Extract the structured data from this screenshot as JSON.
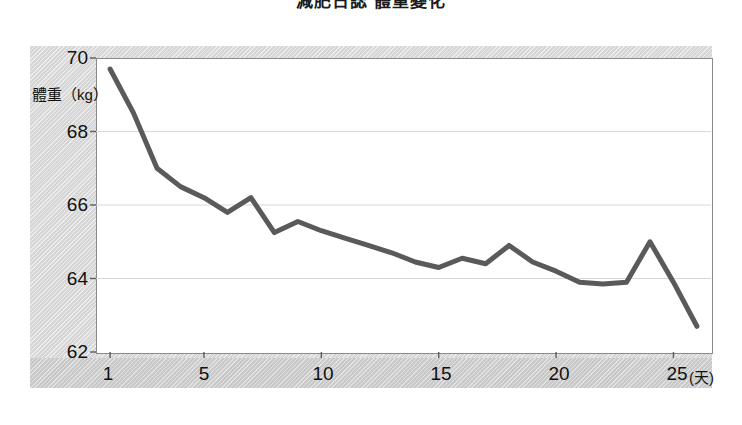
{
  "title": "減肥日誌 體重變化",
  "axes": {
    "y_title": "體重（kg）",
    "y_ticks": [
      70,
      68,
      66,
      64,
      62
    ],
    "x_ticks": [
      1,
      5,
      10,
      15,
      20,
      25
    ],
    "x_unit": "(天)"
  },
  "chart_data": {
    "type": "line",
    "title": "減肥日誌 體重變化",
    "xlabel": "(天)",
    "ylabel": "體重（kg）",
    "xlim": [
      0.4,
      26.6
    ],
    "ylim": [
      62,
      70
    ],
    "grid": true,
    "legend": false,
    "line_color": "#5a5a5a",
    "x": [
      1,
      2,
      3,
      4,
      5,
      6,
      7,
      8,
      9,
      10,
      11,
      12,
      13,
      14,
      15,
      16,
      17,
      18,
      19,
      20,
      21,
      22,
      23,
      24,
      25,
      26
    ],
    "values": [
      69.7,
      68.5,
      67.0,
      66.5,
      66.2,
      65.8,
      66.2,
      65.25,
      65.55,
      65.3,
      65.1,
      64.9,
      64.7,
      64.45,
      64.3,
      64.55,
      64.4,
      64.9,
      64.45,
      64.2,
      63.9,
      63.85,
      63.9,
      65.0,
      63.9,
      62.7
    ],
    "categories": [
      "1",
      "2",
      "3",
      "4",
      "5",
      "6",
      "7",
      "8",
      "9",
      "10",
      "11",
      "12",
      "13",
      "14",
      "15",
      "16",
      "17",
      "18",
      "19",
      "20",
      "21",
      "22",
      "23",
      "24",
      "25",
      "26"
    ],
    "series": [
      {
        "name": "體重（kg）",
        "values": [
          69.7,
          68.5,
          67.0,
          66.5,
          66.2,
          65.8,
          66.2,
          65.25,
          65.55,
          65.3,
          65.1,
          64.9,
          64.7,
          64.45,
          64.3,
          64.55,
          64.4,
          64.9,
          64.45,
          64.2,
          63.9,
          63.85,
          63.9,
          65.0,
          63.9,
          62.7
        ]
      }
    ]
  }
}
